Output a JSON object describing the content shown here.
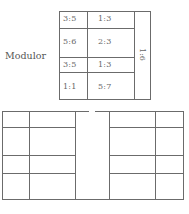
{
  "top_diagram": {
    "label": "Modulor",
    "cells": [
      {
        "col1": "3:5",
        "col2": "1:3"
      },
      {
        "col1": "5:6",
        "col2": "2:3"
      },
      {
        "col1": "3:5",
        "col2": "1:3"
      },
      {
        "col1": "1:1",
        "col2": "5:7"
      }
    ],
    "side_ratio": "1:6"
  },
  "bottom_diagram": {
    "description": "two mirrored grid plans separated by a central gap"
  }
}
